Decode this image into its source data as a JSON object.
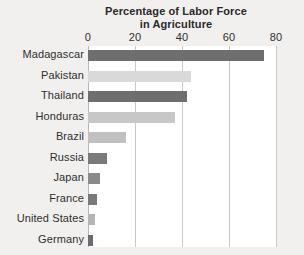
{
  "chart_data": {
    "type": "bar",
    "orientation": "horizontal",
    "title": "Percentage of Labor Force in Agriculture",
    "title_lines": [
      "Percentage of Labor Force",
      "in Agriculture"
    ],
    "xlabel": "",
    "ylabel": "",
    "xlim": [
      0,
      80
    ],
    "xticks": [
      0,
      20,
      40,
      60,
      80
    ],
    "xtick_labels": [
      "0",
      "20",
      "40",
      "60",
      "80"
    ],
    "grid": true,
    "grid_axis": "x",
    "legend": false,
    "categories": [
      "Madagascar",
      "Pakistan",
      "Thailand",
      "Honduras",
      "Brazil",
      "Russia",
      "Japan",
      "France",
      "United States",
      "Germany"
    ],
    "values": [
      75,
      44,
      42,
      37,
      16,
      8,
      5,
      4,
      3,
      2
    ],
    "bar_colors": [
      "#6e6e6e",
      "#d9d9d9",
      "#6e6e6e",
      "#c7c7c7",
      "#c0c0c0",
      "#7a7a7a",
      "#8a8a8a",
      "#7a7a7a",
      "#b5b5b5",
      "#6b6b6b"
    ]
  },
  "colors": {
    "page_background": "#f1f0ee",
    "plot_background": "#ffffff",
    "gridline": "#c9c8c6",
    "text": "#2f2f2f",
    "title": "#2a2a2a",
    "bar_dark": "#6e6e6e",
    "bar_light": "#d9d9d9"
  }
}
